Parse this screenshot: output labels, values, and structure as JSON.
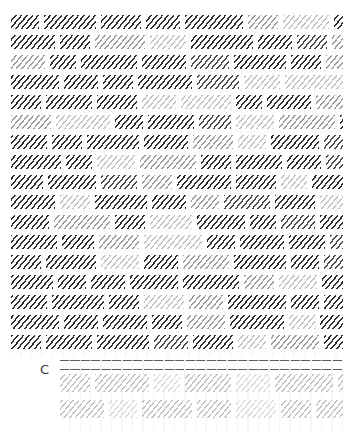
{
  "page": {
    "width": 354,
    "height": 432,
    "background": "#ffffff",
    "kind": "scanned-document-page-obscured"
  },
  "body_text": {
    "name": "obscured-body-text",
    "description": "Main paragraph block rendered illegibly (blurred / hatched) in the source scan",
    "x": 11,
    "y": 13,
    "width": 332,
    "height": 345,
    "line_height": 20,
    "line_count": 17,
    "ink_colors": [
      "#2e2e2e",
      "#4a4a4a",
      "#6f6f6f",
      "#9b9b9b",
      "#c2c2c2",
      "#dadada"
    ],
    "lines": [
      {
        "words": [
          [
            28,
            0
          ],
          [
            52,
            0
          ],
          [
            40,
            0
          ],
          [
            34,
            0
          ],
          [
            58,
            0
          ],
          [
            30,
            3
          ],
          [
            46,
            4
          ],
          [
            44,
            0
          ],
          [
            36,
            0
          ],
          [
            28,
            0
          ]
        ]
      },
      {
        "words": [
          [
            44,
            0
          ],
          [
            30,
            0
          ],
          [
            50,
            3
          ],
          [
            36,
            4
          ],
          [
            62,
            0
          ],
          [
            34,
            0
          ],
          [
            30,
            1
          ],
          [
            48,
            3
          ],
          [
            42,
            4
          ],
          [
            26,
            0
          ]
        ]
      },
      {
        "words": [
          [
            34,
            3
          ],
          [
            26,
            0
          ],
          [
            56,
            0
          ],
          [
            44,
            0
          ],
          [
            38,
            1
          ],
          [
            52,
            0
          ],
          [
            30,
            0
          ],
          [
            40,
            3
          ],
          [
            34,
            4
          ],
          [
            46,
            1
          ]
        ]
      },
      {
        "words": [
          [
            48,
            0
          ],
          [
            34,
            0
          ],
          [
            30,
            0
          ],
          [
            54,
            0
          ],
          [
            42,
            1
          ],
          [
            36,
            4
          ],
          [
            58,
            4
          ],
          [
            28,
            3
          ],
          [
            32,
            0
          ],
          [
            38,
            0
          ]
        ]
      },
      {
        "words": [
          [
            30,
            0
          ],
          [
            46,
            0
          ],
          [
            40,
            0
          ],
          [
            34,
            4
          ],
          [
            50,
            4
          ],
          [
            26,
            0
          ],
          [
            44,
            0
          ],
          [
            36,
            3
          ],
          [
            52,
            1
          ],
          [
            30,
            0
          ]
        ]
      },
      {
        "words": [
          [
            40,
            3
          ],
          [
            54,
            4
          ],
          [
            28,
            0
          ],
          [
            46,
            0
          ],
          [
            32,
            1
          ],
          [
            38,
            4
          ],
          [
            56,
            3
          ],
          [
            30,
            0
          ],
          [
            42,
            0
          ],
          [
            34,
            0
          ]
        ]
      },
      {
        "words": [
          [
            36,
            0
          ],
          [
            30,
            0
          ],
          [
            52,
            0
          ],
          [
            44,
            0
          ],
          [
            40,
            3
          ],
          [
            28,
            4
          ],
          [
            48,
            0
          ],
          [
            34,
            1
          ],
          [
            38,
            0
          ],
          [
            32,
            3
          ]
        ]
      },
      {
        "words": [
          [
            50,
            0
          ],
          [
            26,
            0
          ],
          [
            38,
            4
          ],
          [
            56,
            3
          ],
          [
            30,
            0
          ],
          [
            46,
            0
          ],
          [
            34,
            0
          ],
          [
            42,
            1
          ],
          [
            28,
            4
          ],
          [
            40,
            0
          ]
        ]
      },
      {
        "words": [
          [
            32,
            0
          ],
          [
            48,
            0
          ],
          [
            36,
            1
          ],
          [
            30,
            3
          ],
          [
            54,
            0
          ],
          [
            40,
            0
          ],
          [
            26,
            4
          ],
          [
            50,
            0
          ],
          [
            38,
            0
          ],
          [
            34,
            0
          ]
        ]
      },
      {
        "words": [
          [
            44,
            0
          ],
          [
            30,
            4
          ],
          [
            52,
            0
          ],
          [
            34,
            0
          ],
          [
            28,
            3
          ],
          [
            46,
            1
          ],
          [
            40,
            0
          ],
          [
            36,
            4
          ],
          [
            32,
            0
          ],
          [
            48,
            0
          ]
        ]
      },
      {
        "words": [
          [
            38,
            0
          ],
          [
            56,
            3
          ],
          [
            30,
            0
          ],
          [
            42,
            4
          ],
          [
            48,
            0
          ],
          [
            26,
            0
          ],
          [
            34,
            1
          ],
          [
            52,
            0
          ],
          [
            30,
            3
          ],
          [
            36,
            0
          ]
        ]
      },
      {
        "words": [
          [
            46,
            0
          ],
          [
            32,
            0
          ],
          [
            40,
            3
          ],
          [
            58,
            4
          ],
          [
            28,
            0
          ],
          [
            44,
            0
          ],
          [
            36,
            0
          ],
          [
            30,
            1
          ],
          [
            50,
            0
          ],
          [
            34,
            3
          ]
        ]
      },
      {
        "words": [
          [
            30,
            0
          ],
          [
            50,
            0
          ],
          [
            38,
            4
          ],
          [
            34,
            0
          ],
          [
            46,
            3
          ],
          [
            52,
            0
          ],
          [
            28,
            0
          ],
          [
            40,
            1
          ],
          [
            32,
            0
          ],
          [
            42,
            0
          ]
        ]
      },
      {
        "words": [
          [
            42,
            0
          ],
          [
            28,
            0
          ],
          [
            34,
            0
          ],
          [
            48,
            0
          ],
          [
            56,
            0
          ],
          [
            30,
            3
          ],
          [
            38,
            4
          ],
          [
            44,
            0
          ],
          [
            26,
            0
          ],
          [
            36,
            0
          ]
        ]
      },
      {
        "words": [
          [
            36,
            0
          ],
          [
            52,
            0
          ],
          [
            30,
            0
          ],
          [
            40,
            4
          ],
          [
            34,
            3
          ],
          [
            58,
            0
          ],
          [
            28,
            0
          ],
          [
            46,
            0
          ],
          [
            32,
            1
          ],
          [
            38,
            0
          ]
        ]
      },
      {
        "words": [
          [
            48,
            0
          ],
          [
            34,
            0
          ],
          [
            44,
            0
          ],
          [
            30,
            0
          ],
          [
            38,
            3
          ],
          [
            54,
            0
          ],
          [
            26,
            4
          ],
          [
            42,
            0
          ],
          [
            36,
            0
          ],
          [
            30,
            0
          ]
        ]
      },
      {
        "words": [
          [
            30,
            0
          ],
          [
            46,
            0
          ],
          [
            52,
            0
          ],
          [
            34,
            1
          ],
          [
            40,
            0
          ],
          [
            28,
            4
          ],
          [
            48,
            3
          ],
          [
            36,
            0
          ],
          [
            44,
            0
          ],
          [
            32,
            0
          ]
        ]
      }
    ]
  },
  "caption": {
    "name": "table-caption-letter",
    "label": "C",
    "x": 40,
    "y": 363,
    "color": "#3a3a3a"
  },
  "table": {
    "name": "obscured-table",
    "x": 60,
    "y": 360,
    "width": 283,
    "height": 72,
    "rule_color": "#5d5d5d",
    "rule_positions": [
      0,
      9
    ],
    "header_row_count": 2,
    "row_height": 26,
    "rows": [
      {
        "words": [
          [
            30,
            4
          ],
          [
            54,
            4
          ],
          [
            26,
            5
          ],
          [
            46,
            4
          ],
          [
            34,
            5
          ],
          [
            58,
            4
          ],
          [
            30,
            4
          ],
          [
            42,
            5
          ],
          [
            36,
            4
          ],
          [
            28,
            4
          ]
        ]
      },
      {
        "words": [
          [
            44,
            4
          ],
          [
            28,
            5
          ],
          [
            50,
            4
          ],
          [
            34,
            4
          ],
          [
            40,
            5
          ],
          [
            30,
            4
          ],
          [
            52,
            4
          ],
          [
            26,
            5
          ],
          [
            38,
            4
          ],
          [
            32,
            4
          ]
        ]
      }
    ]
  }
}
